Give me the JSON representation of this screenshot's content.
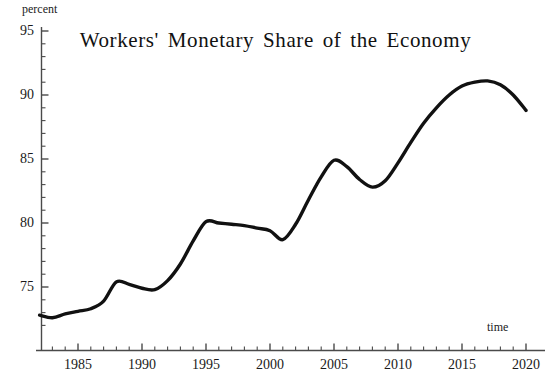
{
  "chart_data": {
    "type": "line",
    "title": "Workers' Monetary Share of the Economy",
    "xlabel": "time",
    "ylabel": "percent",
    "xlim": [
      1982,
      2020.5
    ],
    "ylim": [
      72,
      95
    ],
    "grid": false,
    "legend": false,
    "line_color": "#111111",
    "x_ticks": [
      1985,
      1990,
      1995,
      2000,
      2005,
      2010,
      2015,
      2020
    ],
    "x_tick_labels": [
      "1985",
      "1990",
      "1995",
      "2000",
      "2005",
      "2010",
      "2015",
      "2020"
    ],
    "x_minor_tick_step": 1,
    "y_ticks": [
      75,
      80,
      85,
      90,
      95
    ],
    "y_tick_labels": [
      "75",
      "80",
      "85",
      "90",
      "95"
    ],
    "y_minor_tick_step": 1,
    "series": [
      {
        "name": "Workers' monetary share",
        "x": [
          1982,
          1983,
          1984,
          1985,
          1986,
          1987,
          1988,
          1989,
          1990,
          1991,
          1992,
          1993,
          1994,
          1995,
          1996,
          1997,
          1998,
          1999,
          2000,
          2001,
          2002,
          2003,
          2004,
          2005,
          2006,
          2007,
          2008,
          2009,
          2010,
          2011,
          2012,
          2013,
          2014,
          2015,
          2016,
          2017,
          2018,
          2019,
          2020
        ],
        "values": [
          72.8,
          72.6,
          72.9,
          73.1,
          73.3,
          73.9,
          75.4,
          75.2,
          74.9,
          74.8,
          75.5,
          76.8,
          78.6,
          80.1,
          80.0,
          79.9,
          79.8,
          79.6,
          79.4,
          78.7,
          79.9,
          81.8,
          83.6,
          84.9,
          84.4,
          83.4,
          82.8,
          83.3,
          84.7,
          86.3,
          87.8,
          89.0,
          90.0,
          90.7,
          91.0,
          91.1,
          90.8,
          90.0,
          88.8
        ]
      }
    ],
    "annotations": []
  },
  "figure": {
    "axis_color": "#4a4a4a",
    "background": "#ffffff"
  }
}
